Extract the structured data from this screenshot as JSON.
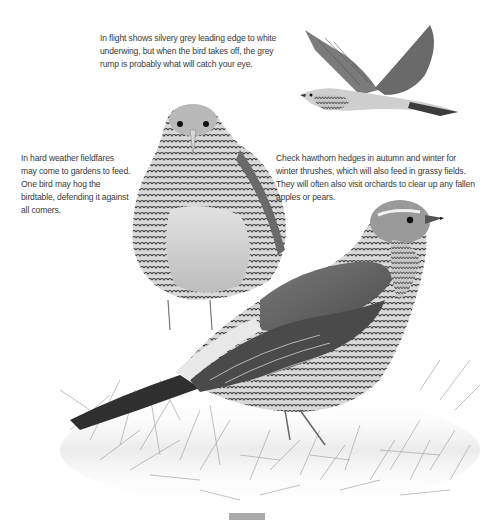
{
  "captions": {
    "flight": {
      "lines": [
        "In flight shows silvery grey leading edge to white",
        "underwing, but when the bird takes off, the grey",
        "rump is probably what will catch your eye."
      ]
    },
    "weather": {
      "lines": [
        "In hard weather fieldfares",
        "may come to gardens to feed.",
        "One bird may hog the",
        "birdtable, defending it against",
        "all comers."
      ]
    },
    "hedges": {
      "lines": [
        "Check hawthorn hedges in autumn and winter for",
        "winter thrushes, which will also feed in grassy fields.",
        "They will often also visit orchards to clear up any fallen",
        "apples or pears."
      ]
    }
  },
  "illustrations": [
    {
      "name": "fieldfare-in-flight"
    },
    {
      "name": "fieldfare-front-view"
    },
    {
      "name": "fieldfare-side-view-on-grass"
    }
  ],
  "colors": {
    "text": "#3a3a3a",
    "background": "#ffffff",
    "page_marker": "#a9a9a9"
  }
}
